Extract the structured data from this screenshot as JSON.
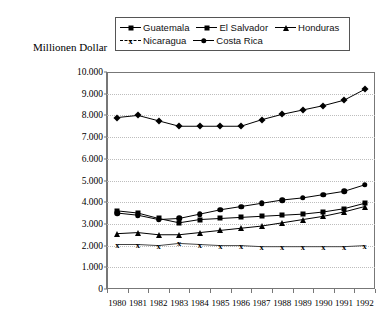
{
  "axis_title": "Millionen Dollar",
  "legend": {
    "rows": [
      [
        {
          "label": "Guatemala",
          "marker": "diamond"
        },
        {
          "label": "El Salvador",
          "marker": "square"
        },
        {
          "label": "Honduras",
          "marker": "triangle"
        }
      ],
      [
        {
          "label": "Nicaragua",
          "marker": "ex"
        },
        {
          "label": "Costa Rica",
          "marker": "circle"
        }
      ]
    ]
  },
  "chart_data": {
    "type": "line",
    "title": "",
    "xlabel": "",
    "ylabel": "Millionen Dollar",
    "ylim": [
      0,
      10000
    ],
    "ytick_labels": [
      "10.000",
      "9.000",
      "8.000",
      "7.000",
      "6.000",
      "5.000",
      "4.000",
      "3.000",
      "2.000",
      "1.000",
      "0"
    ],
    "ytick_values": [
      10000,
      9000,
      8000,
      7000,
      6000,
      5000,
      4000,
      3000,
      2000,
      1000,
      0
    ],
    "grid": true,
    "legend_position": "top",
    "categories": [
      "1980",
      "1981",
      "1982",
      "1983",
      "1984",
      "1985",
      "1986",
      "1987",
      "1988",
      "1989",
      "1990",
      "1991",
      "1992"
    ],
    "series": [
      {
        "name": "Guatemala",
        "marker": "diamond",
        "values": [
          7900,
          8000,
          7750,
          7500,
          7500,
          7500,
          7500,
          7800,
          8050,
          8250,
          8450,
          8700,
          9200
        ]
      },
      {
        "name": "El Salvador",
        "marker": "square",
        "values": [
          3600,
          3500,
          3250,
          3050,
          3200,
          3250,
          3300,
          3350,
          3400,
          3450,
          3550,
          3700,
          3950
        ]
      },
      {
        "name": "Honduras",
        "marker": "triangle",
        "values": [
          2550,
          2600,
          2500,
          2500,
          2600,
          2700,
          2800,
          2900,
          3050,
          3200,
          3350,
          3550,
          3800
        ]
      },
      {
        "name": "Nicaragua",
        "marker": "ex",
        "values": [
          2050,
          2050,
          2000,
          2100,
          2050,
          2000,
          2000,
          1950,
          1950,
          1950,
          1950,
          1950,
          2000
        ]
      },
      {
        "name": "Costa Rica",
        "marker": "circle",
        "values": [
          3500,
          3400,
          3200,
          3250,
          3450,
          3650,
          3800,
          3950,
          4100,
          4200,
          4350,
          4500,
          4800
        ]
      }
    ]
  }
}
